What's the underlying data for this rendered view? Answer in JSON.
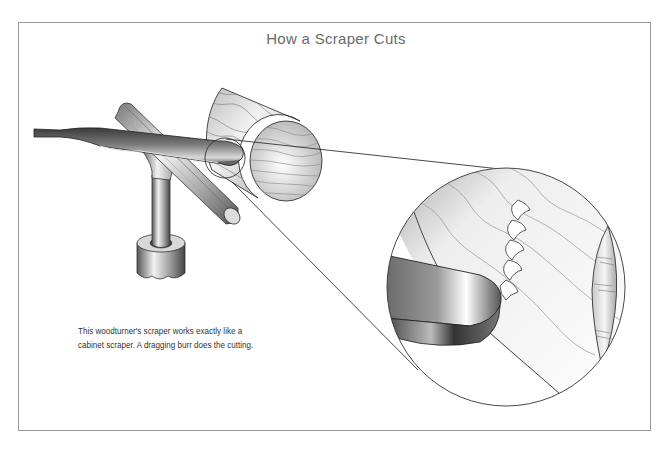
{
  "figure": {
    "title": "How a Scraper Cuts",
    "caption_lines": [
      "This woodturner's scraper works exactly like a",
      "cabinet scraper. A dragging burr does the cutting."
    ]
  },
  "illustration": {
    "parts": [
      "scraper-tool",
      "tool-rest",
      "tool-rest-post",
      "post-collar",
      "wood-log",
      "detail-circle-small",
      "detail-circle-magnified",
      "burr-shavings"
    ],
    "colors": {
      "frame": "#9a9a9a",
      "title": "#6a6a6a",
      "caption": "#333333",
      "line": "#444444",
      "grain": "#8a8a8a"
    }
  }
}
